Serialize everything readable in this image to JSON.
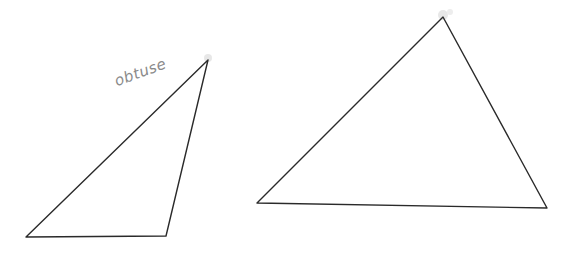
{
  "figure": {
    "background": "#ffffff",
    "stroke_color": "#2a2a2a",
    "triangles": [
      {
        "id": "obtuse-triangle",
        "label": "obtuse",
        "vertices": [
          [
            26,
            237
          ],
          [
            166,
            236
          ],
          [
            208,
            60
          ]
        ]
      },
      {
        "id": "acute-triangle",
        "label": "",
        "vertices": [
          [
            257,
            203
          ],
          [
            547,
            208
          ],
          [
            443,
            17
          ]
        ]
      }
    ],
    "annotations": [
      {
        "text": "obtuse",
        "x": 118,
        "y": 88
      }
    ]
  }
}
